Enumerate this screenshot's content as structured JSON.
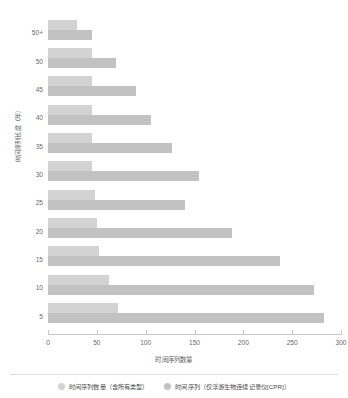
{
  "chart_data": {
    "type": "bar",
    "orientation": "horizontal",
    "title": "",
    "xlabel": "时间序列数量",
    "ylabel": "时间序列长度（年）",
    "categories": [
      "50+",
      "50",
      "45",
      "40",
      "35",
      "30",
      "25",
      "20",
      "15",
      "10",
      "5"
    ],
    "xlim": [
      0,
      300
    ],
    "xticks": [
      0,
      50,
      100,
      150,
      200,
      250,
      300
    ],
    "xtick_labels": [
      "0",
      "50",
      "100",
      "150",
      "200",
      "250",
      "300"
    ],
    "grid": false,
    "legend_position": "bottom",
    "series": [
      {
        "name": "时间序列数量（含所有类型）",
        "color": "#d3d3d3",
        "values": [
          30,
          45,
          45,
          45,
          45,
          45,
          48,
          50,
          52,
          62,
          72
        ]
      },
      {
        "name": "时间序列（仅浮游生物连续记录仪[CPR]）",
        "color": "#c2c2c2",
        "values": [
          45,
          70,
          90,
          105,
          127,
          155,
          140,
          188,
          238,
          272,
          283
        ]
      }
    ]
  },
  "axis": {
    "y_title": "时间序列长度（年）",
    "x_title": "时间序列数量",
    "y_tick_labels": [
      "50+",
      "50",
      "45",
      "40",
      "35",
      "30",
      "25",
      "20",
      "15",
      "10",
      "5"
    ],
    "x_tick_labels": [
      "0",
      "50",
      "100",
      "150",
      "200",
      "250",
      "300"
    ]
  },
  "legend": {
    "items": [
      {
        "label": "时间序列数量（含所有类型）",
        "color": "#d3d3d3"
      },
      {
        "label": "时间序列（仅浮游生物连续记录仪[CPR]）",
        "color": "#c2c2c2"
      }
    ]
  },
  "colors": {
    "series_all_types": "#d3d3d3",
    "series_cpr_only": "#c2c2c2",
    "axis": "#c9c9c9",
    "text": "#5d5d5d",
    "background": "#ffffff"
  }
}
